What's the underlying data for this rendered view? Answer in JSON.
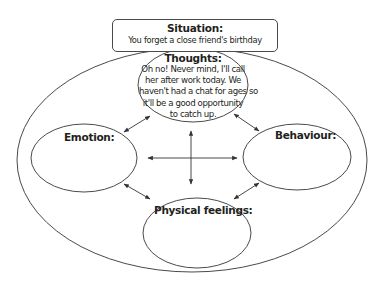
{
  "situation": {
    "title": "Situation:",
    "text": "You forget a close friend's birthday"
  },
  "nodes": {
    "thoughts": {
      "title": "Thoughts:",
      "lines": [
        "Oh no! Never mind, I'll call",
        "her after work today. We",
        "haven't had a chat for ages so",
        "it'll be a good opportunity",
        "to catch up."
      ]
    },
    "emotion": {
      "title": "Emotion:"
    },
    "behaviour": {
      "title": "Behaviour:"
    },
    "physical": {
      "title": "Physical feelings:"
    }
  },
  "connections": [
    [
      "thoughts",
      "emotion"
    ],
    [
      "thoughts",
      "behaviour"
    ],
    [
      "emotion",
      "physical"
    ],
    [
      "behaviour",
      "physical"
    ],
    [
      "center",
      "horizontal-bidirectional"
    ],
    [
      "center",
      "vertical-bidirectional"
    ]
  ],
  "colors": {
    "stroke": "#4a4a4a",
    "text": "#231f20",
    "background": "#ffffff"
  }
}
